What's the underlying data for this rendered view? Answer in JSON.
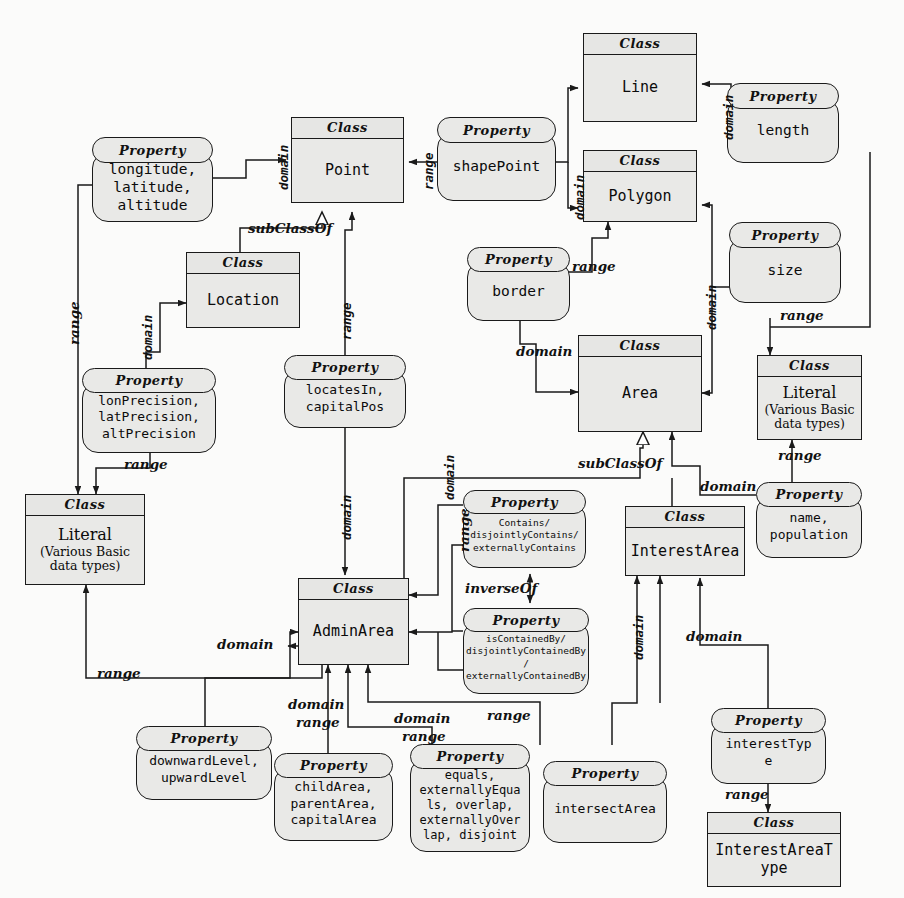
{
  "diagram": {
    "stereotype_class": "Class",
    "stereotype_property": "Property",
    "colors": {
      "node_fill": "#e9e9e7",
      "stroke": "#1a1a1a",
      "background": "#fbfbfa"
    }
  },
  "classes": [
    {
      "id": "line",
      "stereotype": "Class",
      "name": "Line"
    },
    {
      "id": "point",
      "stereotype": "Class",
      "name": "Point"
    },
    {
      "id": "polygon",
      "stereotype": "Class",
      "name": "Polygon"
    },
    {
      "id": "location",
      "stereotype": "Class",
      "name": "Location"
    },
    {
      "id": "area",
      "stereotype": "Class",
      "name": "Area"
    },
    {
      "id": "literal_right",
      "stereotype": "Class",
      "name_big": "Literal",
      "name_small": "(Various Basic\ndata types)"
    },
    {
      "id": "literal_left",
      "stereotype": "Class",
      "name_big": "Literal",
      "name_small": "(Various Basic\ndata types)"
    },
    {
      "id": "adminarea",
      "stereotype": "Class",
      "name": "AdminArea"
    },
    {
      "id": "interestarea",
      "stereotype": "Class",
      "name": "InterestArea"
    },
    {
      "id": "interestareatype",
      "stereotype": "Class",
      "name": "InterestAreaT\nype"
    }
  ],
  "properties": [
    {
      "id": "coords",
      "stereotype": "Property",
      "name": "longitude,\nlatitude,\naltitude"
    },
    {
      "id": "shapepoint",
      "stereotype": "Property",
      "name": "shapePoint"
    },
    {
      "id": "length",
      "stereotype": "Property",
      "name": "length"
    },
    {
      "id": "size",
      "stereotype": "Property",
      "name": "size"
    },
    {
      "id": "border",
      "stereotype": "Property",
      "name": "border"
    },
    {
      "id": "precision",
      "stereotype": "Property",
      "name": "lonPrecision,\nlatPrecision,\naltPrecision"
    },
    {
      "id": "locatesin",
      "stereotype": "Property",
      "name": "locatesIn,\ncapitalPos"
    },
    {
      "id": "contains",
      "stereotype": "Property",
      "name": "Contains/\ndisjointlyContains/\nexternallyContains"
    },
    {
      "id": "iscontainedby",
      "stereotype": "Property",
      "name": "isContainedBy/\ndisjointlyContainedBy\n/\nexternallyContainedBy"
    },
    {
      "id": "namepop",
      "stereotype": "Property",
      "name": "name,\npopulation"
    },
    {
      "id": "levels",
      "stereotype": "Property",
      "name": "downwardLevel,\nupwardLevel"
    },
    {
      "id": "childarea",
      "stereotype": "Property",
      "name": "childArea,\nparentArea,\ncapitalArea"
    },
    {
      "id": "equals",
      "stereotype": "Property",
      "name": "equals,\nexternallyEqua\nls, overlap,\nexternallyOver\nlap, disjoint"
    },
    {
      "id": "intersect",
      "stereotype": "Property",
      "name": "intersectArea"
    },
    {
      "id": "interesttype",
      "stereotype": "Property",
      "name": "interestTyp\ne"
    }
  ],
  "edge_labels": {
    "domain_coords_point": "domain",
    "range_shapepoint_point": "range",
    "domain_shapepoint": "domain",
    "domain_length": "domain",
    "domain_size": "domain",
    "range_size": "range",
    "range_border": "range",
    "domain_border": "domain",
    "subclassof_location_point": "subClassOf",
    "domain_precision_location": "domain",
    "range_precision_literal": "range",
    "range_coords_literal": "range",
    "range_locatesin_point": "range",
    "domain_locatesin_adminarea": "domain",
    "subclassof_adminarea_area": "subClassOf",
    "domain_namepop_area": "domain",
    "range_namepop_literal": "range",
    "domain_contains": "domain",
    "range_contains": "range",
    "inverseof": "inverseOf",
    "domain_levels": "domain",
    "range_levels": "range",
    "domain_childarea": "domain",
    "range_childarea": "range",
    "domain_equals": "domain",
    "range_equals": "range",
    "range_intersect": "range",
    "domain_intersect": "domain",
    "domain_interesttype": "domain",
    "range_interesttype": "range"
  }
}
